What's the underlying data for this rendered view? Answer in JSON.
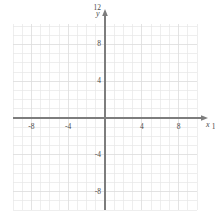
{
  "chart_data": {
    "type": "scatter",
    "title": "",
    "subtitle": "",
    "xlabel": "x",
    "ylabel": "y",
    "xlim": [
      -14,
      10
    ],
    "ylim": [
      -14,
      10
    ],
    "grid": true,
    "grid_step": 1,
    "tick_step": 4,
    "legend": null,
    "series": [],
    "x_tick_labels": [
      "-12",
      "-8",
      "-4",
      "4",
      "8",
      "12"
    ],
    "x_tick_values": [
      -12,
      -8,
      -4,
      4,
      8,
      12
    ],
    "y_tick_labels": [
      "12",
      "8",
      "4",
      "-4",
      "-8",
      "-12"
    ],
    "y_tick_values": [
      12,
      8,
      4,
      -4,
      -8,
      -12
    ],
    "annotations": []
  },
  "figure": {
    "axis_color": "#7d7d7d",
    "grid_color": "#e7e7e7",
    "grid_major_color": "#dcdcdc",
    "text_color": "#4a4a4a",
    "background": "#ffffff"
  },
  "axes": {
    "x_axis_name": "x",
    "y_axis_name": "y",
    "x_arrow": "arrow-right",
    "y_arrow": "arrow-up"
  }
}
